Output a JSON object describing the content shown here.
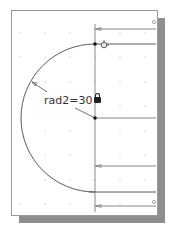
{
  "drawing": {
    "title": "Constrained sketch with radius dimension",
    "dimension": {
      "label": "rad2=30",
      "locked": true,
      "icon": "lock-icon"
    },
    "colors": {
      "paper": "#ffffff",
      "paper_border": "#9a9a9a",
      "shadow": "#8e8e8e",
      "geometry": "#4a4a4a",
      "grid_dot": "#c8c8c8",
      "point": "#111111"
    },
    "geometry": {
      "arc_center": [
        95,
        118
      ],
      "arc_radius": 74,
      "horizontal_lines_y": [
        29,
        44,
        118,
        166,
        192,
        206
      ],
      "vertical_line_x": 95
    }
  }
}
